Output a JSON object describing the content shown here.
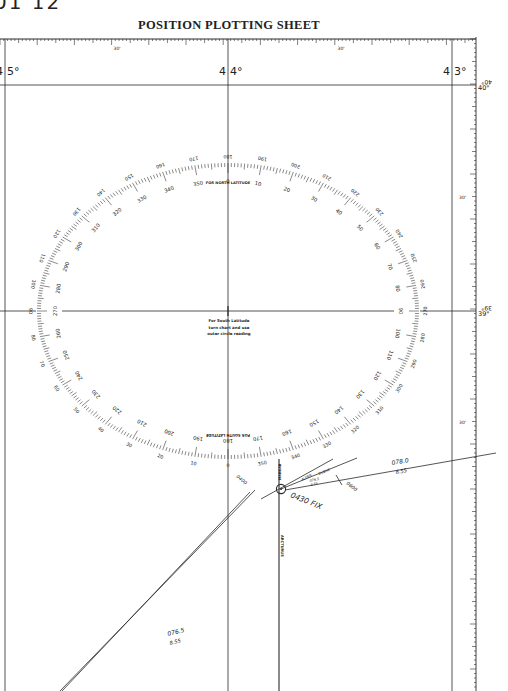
{
  "header": {
    "corner_label": "01 12",
    "title": "POSITION PLOTTING SHEET"
  },
  "longitude_labels": [
    {
      "label": "4 5°",
      "x": 5
    },
    {
      "label": "4 4°",
      "x": 228
    },
    {
      "label": "4 3°",
      "x": 452
    }
  ],
  "top_scale": {
    "minute_label": "30'"
  },
  "latitude_labels": [
    {
      "label": "40°",
      "mirrored": "40°",
      "y": 85
    },
    {
      "label": "39°",
      "mirrored": "39°",
      "y": 311
    }
  ],
  "right_scale": {
    "minute_label": "30'"
  },
  "compass_rose": {
    "inner_top_note": "FOR NORTH LATITUDE",
    "inner_bottom_note": "FOR SOUTH LATITUDE",
    "center_note_lines": [
      "For South Latitude",
      "turn chart and use",
      "outer circle reading"
    ]
  },
  "plot": {
    "fix_label": "0430 FIX",
    "lop_left": {
      "course": "076.5",
      "distance": "8.55",
      "time": "0400"
    },
    "lop_right": {
      "course": "078.0",
      "distance": "8.55",
      "time": "0600"
    },
    "star_lines": [
      "ARCTURUS",
      "ALTAIR",
      "DUBHE",
      "MARKAB"
    ],
    "small_course": {
      "course": "076.5",
      "distance": "8.55"
    }
  }
}
